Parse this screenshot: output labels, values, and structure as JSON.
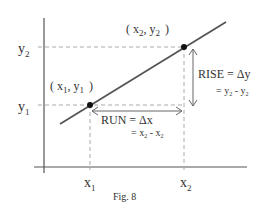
{
  "figure": {
    "caption": "Fig. 8",
    "axis_labels": {
      "y2": {
        "base": "y",
        "sub": "2"
      },
      "y1": {
        "base": "y",
        "sub": "1"
      },
      "x1": {
        "base": "x",
        "sub": "1"
      },
      "x2": {
        "base": "x",
        "sub": "2"
      }
    },
    "points": {
      "p1": {
        "open": "( x",
        "sub1": "1",
        "mid": ", y",
        "sub2": "1",
        "close": ")"
      },
      "p2": {
        "open": "( x",
        "sub1": "2",
        "mid": ", y",
        "sub2": "2",
        "close": ")"
      }
    },
    "rise": {
      "line1": "RISE = Δy",
      "line2_prefix": "= y",
      "line2_sub1": "2",
      "line2_mid": " - y",
      "line2_sub2": "2"
    },
    "run": {
      "line1": "RUN = Δx",
      "line2_prefix": "= x",
      "line2_sub1": "2",
      "line2_mid": " - x",
      "line2_sub2": "2"
    },
    "colors": {
      "axis": "#555555",
      "line": "#555555",
      "dashed": "#aaaaaa",
      "point": "#111111",
      "text": "#333333"
    }
  }
}
